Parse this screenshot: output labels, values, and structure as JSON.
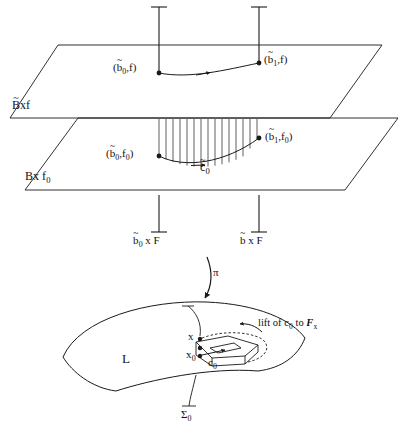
{
  "figure": {
    "stroke_color": "#1a1a1a",
    "background": "#ffffff"
  },
  "upper_plane": {
    "name_label": "Bxf",
    "name_base": "B",
    "name_accent": "~",
    "name_rest": "xf",
    "left_point_label_open": "(",
    "left_point_base": "b",
    "left_point_accent": "~",
    "left_point_sub": "0",
    "left_point_rest": ",f)",
    "right_point_open": "(",
    "right_point_base": "b",
    "right_point_accent": "~",
    "right_point_sub": "1",
    "right_point_rest": ",f)"
  },
  "lower_plane": {
    "name_base": "B",
    "name_rest": "x f",
    "name_sub": "0",
    "left_point_open": "(",
    "left_point_base": "b",
    "left_point_accent": "~",
    "left_point_sub": "0",
    "left_point_mid": ",f",
    "left_point_sub2": "0",
    "left_point_close": ")",
    "right_point_open": "(",
    "right_point_base": "b",
    "right_point_accent": "~",
    "right_point_sub": "1",
    "right_point_mid": ",f",
    "right_point_sub2": "0",
    "right_point_close": ")",
    "curve_base": "c",
    "curve_accent": "~",
    "curve_sub": "0"
  },
  "fibers": {
    "left_base": "b",
    "left_accent": "~",
    "left_sub": "0",
    "left_rest": " x F",
    "right_base": "b",
    "right_accent": "~",
    "right_rest": " x F"
  },
  "projection": {
    "symbol": "π"
  },
  "base_surface": {
    "surface_label": "L",
    "sigma_base": "Σ",
    "sigma_sub": "0",
    "point_upper": "x",
    "point_lower_base": "x",
    "point_lower_sub": "0",
    "curve_base": "c",
    "curve_sub": "0",
    "annotation_prefix": "lift of ",
    "annotation_c": "c",
    "annotation_c_sub": "0",
    "annotation_to": " to ",
    "annotation_F": "F",
    "annotation_F_sub": "x"
  }
}
